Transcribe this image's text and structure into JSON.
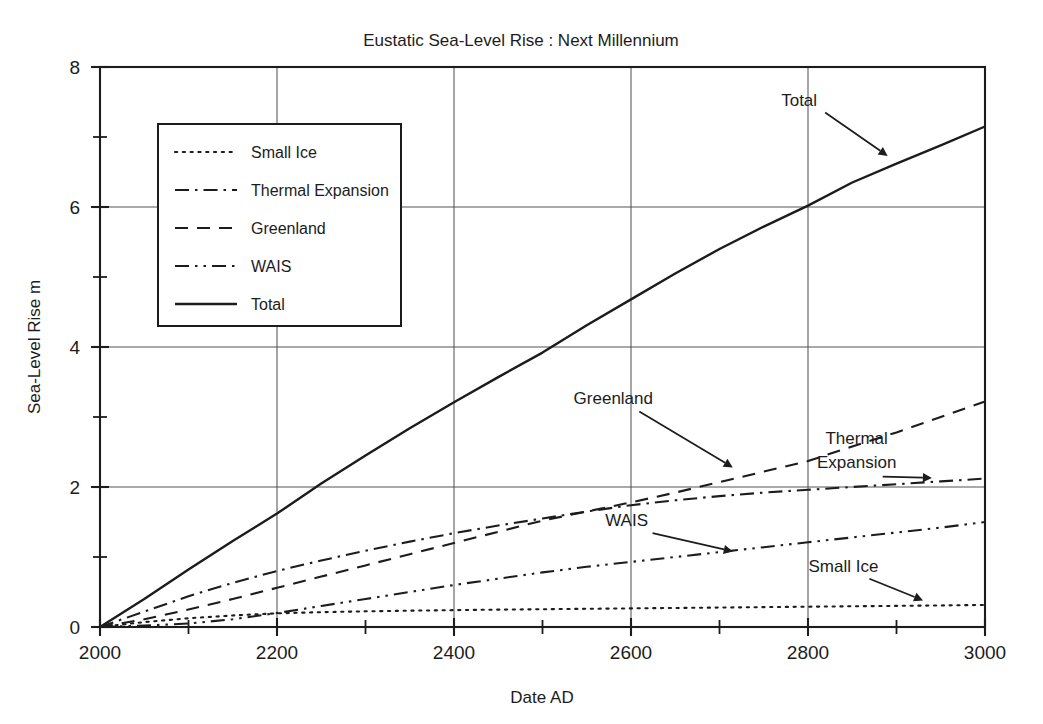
{
  "chart_data": {
    "type": "line",
    "title": "Eustatic Sea-Level Rise : Next Millennium",
    "xlabel": "Date  AD",
    "ylabel": "Sea-Level Rise  m",
    "xlim": [
      2000,
      3000
    ],
    "ylim": [
      0,
      8
    ],
    "grid": true,
    "x_ticks": [
      2000,
      2200,
      2400,
      2600,
      2800,
      3000
    ],
    "x_tick_labels": [
      "2000",
      "2200",
      "2400",
      "2600",
      "2800",
      "3000"
    ],
    "x_minor_ticks": [
      2100,
      2300,
      2500,
      2700,
      2900
    ],
    "y_ticks": [
      0,
      2,
      4,
      6,
      8
    ],
    "y_tick_labels": [
      "0",
      "2",
      "4",
      "6",
      "8"
    ],
    "y_minor_ticks": [
      1,
      3,
      5,
      7
    ],
    "legend_position": "upper-left-inset",
    "x": [
      2000,
      2050,
      2100,
      2150,
      2200,
      2250,
      2300,
      2350,
      2400,
      2450,
      2500,
      2550,
      2600,
      2650,
      2700,
      2750,
      2800,
      2850,
      2900,
      2950,
      3000
    ],
    "series": [
      {
        "name": "Small Ice",
        "style": "dotted",
        "values": [
          0.0,
          0.07,
          0.125,
          0.165,
          0.195,
          0.212,
          0.224,
          0.233,
          0.241,
          0.248,
          0.254,
          0.26,
          0.266,
          0.272,
          0.278,
          0.284,
          0.29,
          0.296,
          0.302,
          0.308,
          0.315
        ]
      },
      {
        "name": "Thermal Expansion",
        "style": "dash-dot",
        "values": [
          0.0,
          0.22,
          0.44,
          0.63,
          0.8,
          0.95,
          1.09,
          1.22,
          1.34,
          1.45,
          1.55,
          1.65,
          1.74,
          1.81,
          1.87,
          1.92,
          1.96,
          2.0,
          2.04,
          2.08,
          2.12
        ]
      },
      {
        "name": "Greenland",
        "style": "dashed",
        "values": [
          0.0,
          0.11,
          0.25,
          0.4,
          0.56,
          0.72,
          0.88,
          1.04,
          1.2,
          1.36,
          1.52,
          1.65,
          1.78,
          1.92,
          2.07,
          2.22,
          2.37,
          2.58,
          2.78,
          3.0,
          3.22
        ]
      },
      {
        "name": "WAIS",
        "style": "dash-dot-dot",
        "values": [
          0.0,
          0.02,
          0.05,
          0.11,
          0.2,
          0.3,
          0.4,
          0.5,
          0.6,
          0.69,
          0.78,
          0.86,
          0.93,
          1.0,
          1.07,
          1.14,
          1.21,
          1.28,
          1.35,
          1.42,
          1.5
        ]
      },
      {
        "name": "Total",
        "style": "solid",
        "values": [
          0.0,
          0.4,
          0.82,
          1.23,
          1.62,
          2.05,
          2.45,
          2.84,
          3.21,
          3.57,
          3.92,
          4.31,
          4.68,
          5.05,
          5.4,
          5.72,
          6.02,
          6.35,
          6.62,
          6.88,
          7.15
        ]
      }
    ],
    "annotations": [
      {
        "text": "Total",
        "label_x": 2790,
        "label_y": 7.45,
        "tip_x": 2890,
        "tip_y": 6.73
      },
      {
        "text": "Greenland",
        "label_x": 2580,
        "label_y": 3.18,
        "tip_x": 2715,
        "tip_y": 2.28
      },
      {
        "text_line1": "Thermal",
        "text_line2": "Expansion",
        "label_x": 2855,
        "label_y": 2.62,
        "tip_x": 2940,
        "tip_y": 2.13
      },
      {
        "text": "WAIS",
        "label_x": 2595,
        "label_y": 1.44,
        "tip_x": 2715,
        "tip_y": 1.08
      },
      {
        "text": "Small Ice",
        "label_x": 2840,
        "label_y": 0.79,
        "tip_x": 2930,
        "tip_y": 0.38
      }
    ]
  },
  "legend": {
    "items": [
      {
        "label": "Small Ice",
        "style": "dotted"
      },
      {
        "label": "Thermal Expansion",
        "style": "dash-dot"
      },
      {
        "label": "Greenland",
        "style": "dashed"
      },
      {
        "label": "WAIS",
        "style": "dash-dot-dot"
      },
      {
        "label": "Total",
        "style": "solid"
      }
    ]
  },
  "colors": {
    "ink": "#1c1c1c",
    "grid": "#555555",
    "background": "#ffffff"
  }
}
